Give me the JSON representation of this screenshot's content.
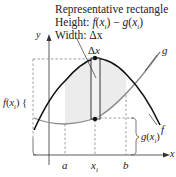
{
  "figure": {
    "type": "area-between-curves-diagram",
    "annotation": {
      "line1": "Representative rectangle",
      "line2_prefix": "Height: ",
      "line2_formula": "f(x_i) − g(x_i)",
      "line3_prefix": "Width: ",
      "line3_formula": "Δx"
    },
    "axes": {
      "x_label": "x",
      "y_label": "y"
    },
    "curves": [
      {
        "name": "f",
        "label": "f",
        "color": "#111111",
        "shape": "concave-down"
      },
      {
        "name": "g",
        "label": "g",
        "color": "#8a8a8a",
        "shape": "concave-up"
      }
    ],
    "rectangle": {
      "width_label": "Δx",
      "at": "x_i"
    },
    "x_ticks": [
      "a",
      "x_i",
      "b"
    ],
    "brace_labels": {
      "left": "f(x_i)",
      "right": "g(x_i)"
    },
    "colors": {
      "region_fill": "#ececec",
      "axis": "#333333",
      "dashed": "#777777"
    }
  }
}
